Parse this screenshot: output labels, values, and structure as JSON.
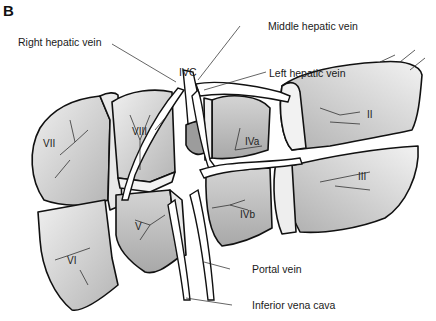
{
  "figure": {
    "panel_letter": "B"
  },
  "callouts": {
    "right_hepatic_vein": "Right hepatic vein",
    "ivc_top": "IVC",
    "middle_hepatic_vein": "Middle hepatic vein",
    "left_hepatic_vein": "Left hepatic vein",
    "portal_vein": "Portal vein",
    "inferior_vena_cava": "Inferior vena cava"
  },
  "segments": {
    "ii": "II",
    "iii": "III",
    "iva": "IVa",
    "ivb": "IVb",
    "v": "V",
    "vi": "VI",
    "vii": "VII",
    "viii": "VIII"
  },
  "colors": {
    "outline": "#111111",
    "lobe_fill_light": "#e6e6e6",
    "lobe_fill_dark": "#b8b8b8",
    "vessel_fill": "#ffffff",
    "background": "#ffffff"
  }
}
